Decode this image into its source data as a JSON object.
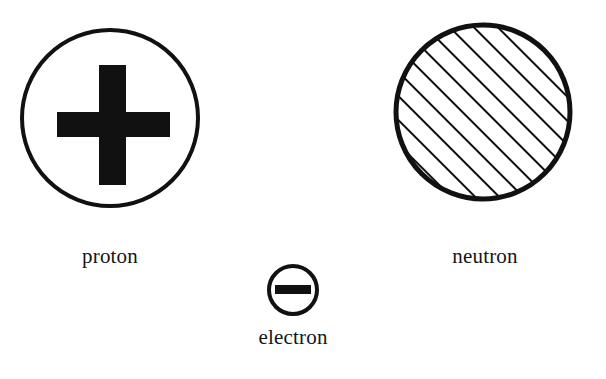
{
  "figure": {
    "background_color": "#ffffff",
    "ink_color": "#111111",
    "width": 606,
    "height": 379
  },
  "particles": [
    {
      "id": "proton",
      "label": "proton",
      "symbol": "plus",
      "symbol_text": "+",
      "charge": "positive",
      "shape": "circle",
      "fill": "white",
      "outline_color": "#111111",
      "center_x": 110,
      "center_y": 118,
      "radius": 88,
      "outline_width": 4
    },
    {
      "id": "neutron",
      "label": "neutron",
      "symbol": "hatching",
      "symbol_text": "",
      "charge": "neutral",
      "shape": "circle",
      "fill": "diagonal-hatch",
      "outline_color": "#111111",
      "center_x": 483,
      "center_y": 112,
      "radius": 90,
      "outline_width": 5,
      "hatch_spacing": 17,
      "hatch_angle_deg": 45,
      "hatch_width": 4
    },
    {
      "id": "electron",
      "label": "electron",
      "symbol": "minus",
      "symbol_text": "–",
      "charge": "negative",
      "shape": "circle",
      "fill": "white",
      "outline_color": "#111111",
      "center_x": 293,
      "center_y": 290,
      "radius": 25,
      "outline_width": 4
    }
  ]
}
